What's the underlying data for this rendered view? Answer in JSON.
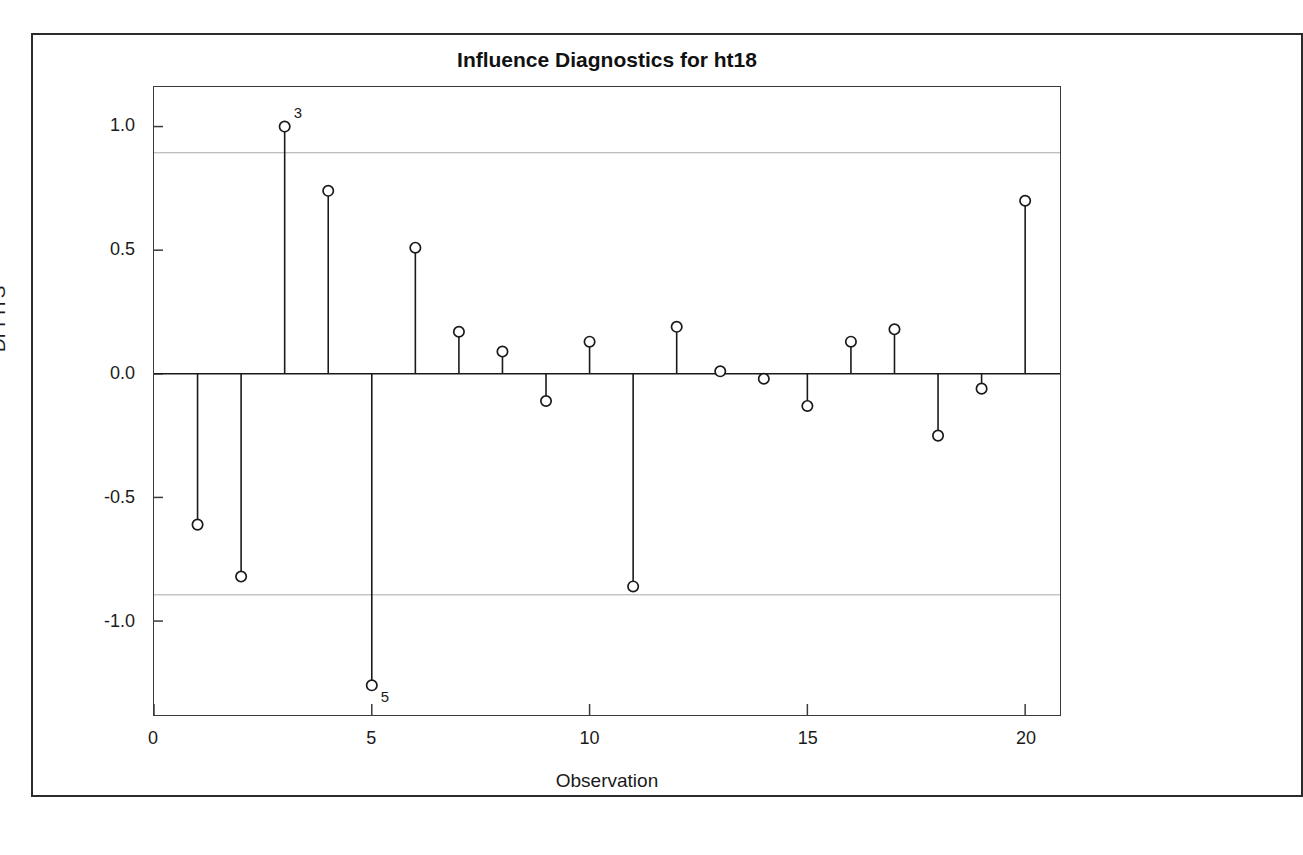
{
  "figure": {
    "title": "Influence Diagnostics for ht18",
    "x_axis_title": "Observation",
    "y_axis_title": "DFFITS",
    "frame_color": "#2b2b2b",
    "axis_color": "#3a3a3a",
    "reference_line_color": "#a8a8a8",
    "marker_color": "#1a1a1a",
    "needle_color": "#1a1a1a"
  },
  "chart_data": {
    "type": "scatter",
    "title": "Influence Diagnostics for ht18",
    "xlabel": "Observation",
    "ylabel": "DFFITS",
    "xlim": [
      0,
      20.8
    ],
    "ylim": [
      -1.38,
      1.16
    ],
    "xticks": [
      0,
      5,
      10,
      15,
      20
    ],
    "xticklabels": [
      "0",
      "5",
      "10",
      "15",
      "20"
    ],
    "yticks": [
      1.0,
      0.5,
      0.0,
      -0.5,
      -1.0
    ],
    "yticklabels": [
      "1.0",
      "0.5",
      "0.0",
      "-0.5",
      "-1.0"
    ],
    "grid": false,
    "legend": null,
    "baseline": 0.0,
    "reference_lines": [
      0.894,
      -0.894
    ],
    "x": [
      1,
      2,
      3,
      4,
      5,
      6,
      7,
      8,
      9,
      10,
      11,
      12,
      13,
      14,
      15,
      16,
      17,
      18,
      19,
      20
    ],
    "values": [
      -0.61,
      -0.82,
      1.0,
      0.74,
      -1.26,
      0.51,
      0.17,
      0.09,
      -0.11,
      0.13,
      -0.86,
      0.19,
      0.01,
      -0.02,
      -0.13,
      0.13,
      0.18,
      -0.25,
      -0.06,
      0.7
    ],
    "annotations": [
      {
        "x": 3,
        "y": 1.0,
        "label": "3"
      },
      {
        "x": 5,
        "y": -1.26,
        "label": "5"
      }
    ]
  }
}
